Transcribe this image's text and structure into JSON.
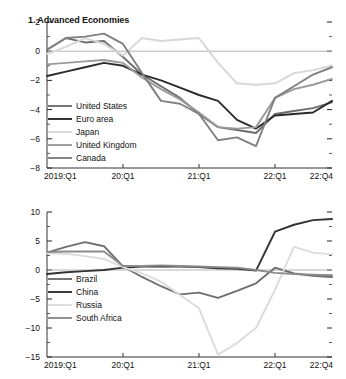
{
  "figure": {
    "background": "#ffffff",
    "text_color": "#111111"
  },
  "chart_data": [
    {
      "type": "line",
      "panel_number": "1.",
      "title": "1. Advanced Economies",
      "xlabel": "",
      "ylabel": "",
      "ylim": [
        -8,
        2
      ],
      "yticks": [
        2,
        0,
        -2,
        -4,
        -6,
        -8
      ],
      "ytick_labels": [
        "2",
        "0",
        "−2",
        "−4",
        "−6",
        "−8"
      ],
      "grid": false,
      "zero_line": true,
      "legend_position": "inner-left",
      "x": [
        "2019:Q1",
        "2019:Q2",
        "2019:Q3",
        "2019:Q4",
        "20:Q1",
        "20:Q2",
        "20:Q3",
        "20:Q4",
        "21:Q1",
        "21:Q2",
        "21:Q3",
        "21:Q4",
        "22:Q1",
        "22:Q2",
        "22:Q3",
        "22:Q4"
      ],
      "xtick_labels": [
        "2019:Q1",
        "20:Q1",
        "21:Q1",
        "22:Q1",
        "22:Q4"
      ],
      "xtick_positions": [
        0,
        4,
        8,
        12,
        15
      ],
      "series": [
        {
          "name": "United States",
          "color": "#6e6e6e",
          "width": 1.9,
          "values": [
            0.1,
            0.9,
            0.6,
            0.7,
            -0.4,
            -1.6,
            -2.4,
            -3.2,
            -4.3,
            -5.2,
            -5.4,
            -5.6,
            -4.3,
            -4.1,
            -3.9,
            -3.5
          ]
        },
        {
          "name": "Euro area",
          "color": "#2b2b2b",
          "width": 1.9,
          "values": [
            -1.7,
            -1.4,
            -1.1,
            -0.8,
            -1.0,
            -1.6,
            -2.0,
            -2.5,
            -3.0,
            -3.4,
            -4.7,
            -5.3,
            -4.4,
            -4.3,
            -4.2,
            -3.4
          ]
        },
        {
          "name": "Japan",
          "color": "#d7d7d7",
          "width": 1.9,
          "values": [
            -0.2,
            0.3,
            0.9,
            0.5,
            -0.3,
            0.9,
            0.7,
            0.8,
            0.9,
            -0.8,
            -2.2,
            -2.3,
            -2.2,
            -1.5,
            -1.3,
            -1.0
          ]
        },
        {
          "name": "United Kingdom",
          "color": "#9a9a9a",
          "width": 1.9,
          "values": [
            -0.9,
            -0.8,
            -0.7,
            -0.6,
            -0.8,
            -1.8,
            -2.6,
            -3.3,
            -4.2,
            -5.2,
            -5.3,
            -5.2,
            -3.2,
            -2.6,
            -2.3,
            -1.9
          ]
        },
        {
          "name": "Canada",
          "color": "#808080",
          "width": 1.9,
          "values": [
            0.1,
            0.9,
            1.0,
            1.2,
            0.5,
            -1.5,
            -3.4,
            -3.6,
            -4.3,
            -6.1,
            -5.9,
            -6.5,
            -3.2,
            -2.4,
            -1.6,
            -1.1
          ]
        }
      ]
    },
    {
      "type": "line",
      "panel_number": "2.",
      "title": "2. Emerging Market and Developing Economies",
      "xlabel": "",
      "ylabel": "",
      "ylim": [
        -15,
        10
      ],
      "yticks": [
        10,
        5,
        0,
        -5,
        -10,
        -15
      ],
      "ytick_labels": [
        "10",
        "5",
        "0",
        "−5",
        "−10",
        "−15"
      ],
      "grid": false,
      "zero_line": true,
      "legend_position": "inner-left",
      "x": [
        "2019:Q1",
        "2019:Q2",
        "2019:Q3",
        "2019:Q4",
        "20:Q1",
        "20:Q2",
        "20:Q3",
        "20:Q4",
        "21:Q1",
        "21:Q2",
        "21:Q3",
        "21:Q4",
        "22:Q1",
        "22:Q2",
        "22:Q3",
        "22:Q4"
      ],
      "xtick_labels": [
        "2019:Q1",
        "20:Q1",
        "21:Q1",
        "22:Q1",
        "22:Q4"
      ],
      "xtick_positions": [
        0,
        4,
        8,
        12,
        15
      ],
      "series": [
        {
          "name": "Brazil",
          "color": "#6e6e6e",
          "width": 1.9,
          "values": [
            3.0,
            4.0,
            4.8,
            4.1,
            0.6,
            -1.2,
            -2.8,
            -4.2,
            -3.9,
            -4.8,
            -3.6,
            -2.3,
            0.4,
            -0.6,
            -1.0,
            -1.2
          ]
        },
        {
          "name": "China",
          "color": "#333333",
          "width": 1.9,
          "values": [
            -0.7,
            -0.4,
            -0.2,
            0.0,
            0.4,
            0.6,
            0.6,
            0.6,
            0.5,
            0.3,
            0.2,
            -0.1,
            6.6,
            7.8,
            8.6,
            8.8
          ]
        },
        {
          "name": "Russia",
          "color": "#dcdcdc",
          "width": 1.9,
          "values": [
            2.9,
            2.8,
            2.4,
            1.9,
            0.5,
            -0.6,
            -2.0,
            -4.3,
            -6.6,
            -14.6,
            -12.6,
            -10.0,
            -3.4,
            4.0,
            3.0,
            2.7
          ]
        },
        {
          "name": "South Africa",
          "color": "#8c8c8c",
          "width": 1.9,
          "values": [
            3.1,
            3.2,
            3.2,
            3.2,
            0.7,
            0.7,
            0.8,
            0.7,
            0.6,
            0.5,
            0.4,
            0.0,
            -0.5,
            -0.7,
            -0.8,
            -0.9
          ]
        }
      ]
    }
  ]
}
